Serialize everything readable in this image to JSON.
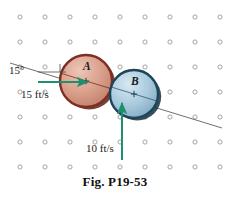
{
  "figure": {
    "caption": "Fig. P19-53",
    "background_color": "#ffffff",
    "grid": {
      "dot_color": "#9a9a9a",
      "x_start": 20,
      "y_start": 17,
      "spacing_x": 25,
      "spacing_y": 25,
      "cols": 9,
      "rows": 7,
      "dot_radius": 2.1
    },
    "bodies": [
      {
        "id": "A",
        "label": "A",
        "cx": 86,
        "cy": 81,
        "r": 26,
        "fill": "#d79b87",
        "fill_light": "#e8bdae",
        "rim": "#7d2f24",
        "shadow": "#5d2119"
      },
      {
        "id": "B",
        "label": "B",
        "cx": 134,
        "cy": 94,
        "r": 24,
        "fill": "#a9c9de",
        "fill_light": "#cfe3ef",
        "rim": "#1c4558",
        "shadow": "#17323f"
      }
    ],
    "line_of_impact": {
      "x1": 10,
      "y1": 63,
      "x2": 222,
      "y2": 128,
      "color": "#4a4a4a"
    },
    "angle": {
      "label": "15°",
      "value": 15,
      "unit": "degrees",
      "ref_x1": 38,
      "ref_y1": 72,
      "ref_x2": 66,
      "ref_y2": 72,
      "tick_x": 60,
      "tick_y1": 64,
      "tick_y2": 72
    },
    "velocities": [
      {
        "body": "A",
        "label": "15 ft/s",
        "magnitude": 15,
        "unit": "ft/s",
        "direction": "right",
        "color": "#1f8f6f",
        "x1": 38,
        "y1": 82,
        "x2": 88,
        "y2": 82
      },
      {
        "body": "B",
        "label": "10 ft/s",
        "magnitude": 10,
        "unit": "ft/s",
        "direction": "up",
        "color": "#1f8f6f",
        "x1": 122,
        "y1": 160,
        "x2": 122,
        "y2": 103
      }
    ]
  }
}
